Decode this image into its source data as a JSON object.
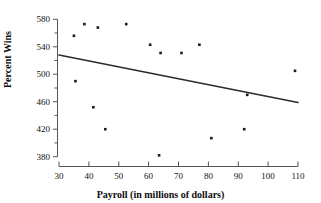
{
  "chart_data": {
    "type": "scatter",
    "title": "",
    "xlabel": "Payroll (in millions of dollars)",
    "ylabel": "Percent Wins",
    "xlim": [
      30,
      110
    ],
    "ylim": [
      380,
      580
    ],
    "xticks": [
      30,
      40,
      50,
      60,
      70,
      80,
      90,
      100,
      110
    ],
    "yticks": [
      380,
      420,
      460,
      500,
      540,
      580
    ],
    "grid": false,
    "legend": null,
    "marker_color": "#1a1a1a",
    "line_color": "#2b2b2b",
    "points": [
      {
        "x": 35.0,
        "y": 556
      },
      {
        "x": 35.5,
        "y": 490
      },
      {
        "x": 38.5,
        "y": 573
      },
      {
        "x": 41.5,
        "y": 452
      },
      {
        "x": 43.0,
        "y": 568
      },
      {
        "x": 45.5,
        "y": 420
      },
      {
        "x": 52.5,
        "y": 573
      },
      {
        "x": 60.5,
        "y": 543
      },
      {
        "x": 63.5,
        "y": 382
      },
      {
        "x": 64.0,
        "y": 531
      },
      {
        "x": 71.0,
        "y": 531
      },
      {
        "x": 77.0,
        "y": 543
      },
      {
        "x": 81.0,
        "y": 407
      },
      {
        "x": 92.0,
        "y": 420
      },
      {
        "x": 93.0,
        "y": 470
      },
      {
        "x": 109.0,
        "y": 505
      }
    ],
    "trend_line": {
      "type": "linear-regression",
      "x_start": 30,
      "y_start": 528,
      "x_end": 110,
      "y_end": 459
    }
  },
  "axis": {
    "x_title": "Payroll (in millions of dollars)",
    "y_title": "Percent Wins",
    "x_tick_labels": [
      "30",
      "40",
      "50",
      "60",
      "70",
      "80",
      "90",
      "100",
      "110"
    ],
    "y_tick_labels": [
      "580",
      "540",
      "500",
      "460",
      "420",
      "380"
    ]
  }
}
